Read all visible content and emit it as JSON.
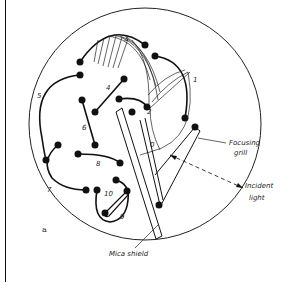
{
  "figure": {
    "panel_label": "a",
    "electrode_labels": [
      "0",
      "1",
      "2",
      "3",
      "4",
      "5",
      "6",
      "7",
      "8",
      "9",
      "10"
    ],
    "callouts": {
      "focusing_grill": [
        "Focusing",
        "grill"
      ],
      "incident_light": [
        "Incident",
        "light"
      ],
      "mica_shield": "Mica shield"
    }
  }
}
